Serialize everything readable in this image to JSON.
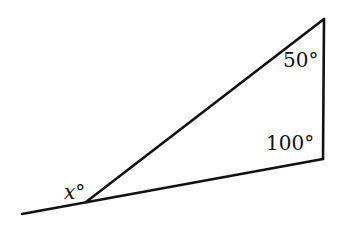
{
  "diagram": {
    "type": "triangle-exterior-angle",
    "stroke_color": "#111111",
    "vertices": {
      "top": [
        324,
        19
      ],
      "bottom_right": [
        323,
        159
      ],
      "left": [
        86,
        202
      ],
      "extension_end": [
        22,
        214
      ]
    },
    "labels": {
      "top_angle": "50°",
      "bottom_right_angle": "100°",
      "exterior_angle": "x°"
    }
  }
}
